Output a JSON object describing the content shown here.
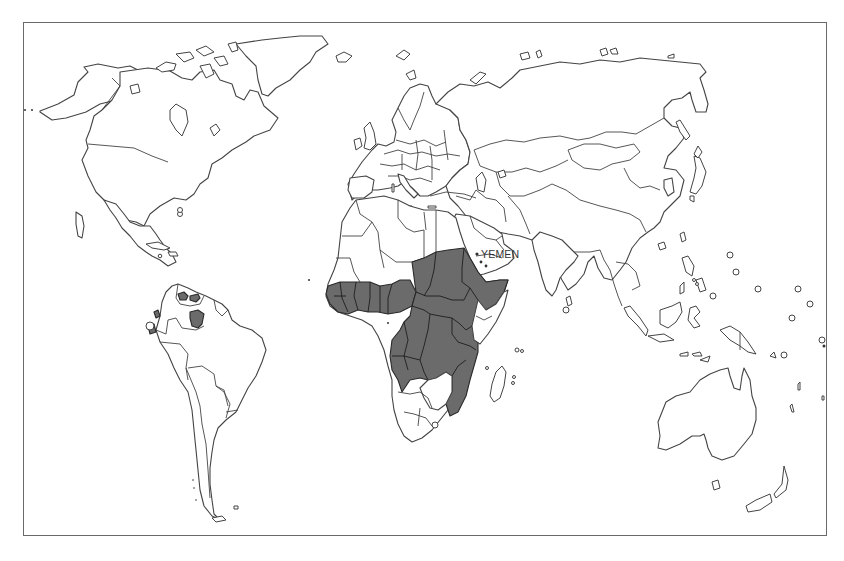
{
  "map": {
    "type": "world-outline-choropleth",
    "projection": "equirectangular-like",
    "frame": {
      "visible": true,
      "color": "#6a6a6a"
    },
    "colors": {
      "land_fill": "#ffffff",
      "outline": "#444444",
      "highlighted_fill": "#6b6b6b",
      "background": "#ffffff"
    },
    "labels": [
      {
        "text": "YEMEN",
        "x": 481,
        "y": 258
      }
    ],
    "highlighted_regions": [
      {
        "name": "West Africa (Senegal–Nigeria belt)"
      },
      {
        "name": "Central Africa (Cameroon, CAR, Chad, Congo, DRC, Gabon)"
      },
      {
        "name": "Sudan"
      },
      {
        "name": "Ethiopia"
      },
      {
        "name": "Uganda / South Sudan region"
      },
      {
        "name": "Angola"
      },
      {
        "name": "Tanzania"
      },
      {
        "name": "Mozambique"
      },
      {
        "name": "Malawi"
      },
      {
        "name": "Northern Venezuela foci"
      },
      {
        "name": "Southern Venezuela focus"
      },
      {
        "name": "Colombia focus"
      },
      {
        "name": "Ecuador focus"
      },
      {
        "name": "Yemen foci (dots)"
      }
    ],
    "legend": null
  }
}
